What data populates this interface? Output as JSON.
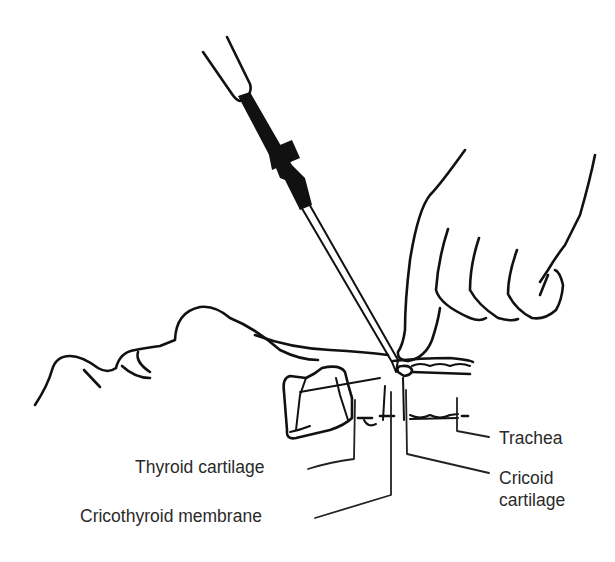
{
  "figure": {
    "ink_color": "#111111",
    "background": "#ffffff",
    "labels": {
      "thyroid_cartilage": "Thyroid cartilage",
      "cricothyroid_membrane": "Cricothyroid membrane",
      "trachea": "Trachea",
      "cricoid_cartilage": "Cricoid cartilage"
    },
    "elements": [
      "needle-with-hub",
      "hand-palpating-neck",
      "head-profile",
      "larynx-cross-section",
      "trachea"
    ]
  }
}
